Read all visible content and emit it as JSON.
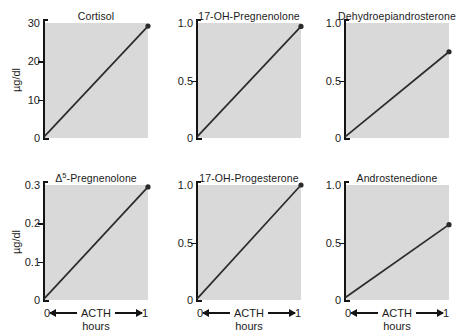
{
  "figure": {
    "layout": {
      "rows": 2,
      "cols": 3
    },
    "axis_color": "#141414",
    "plot_background": "#d9d9d9",
    "line_color": "#2b2b2b",
    "marker_color": "#2b2b2b"
  },
  "chart_data": [
    {
      "type": "line",
      "title": "Cortisol",
      "xlabel": "ACTH hours",
      "ylabel": "µg/dl",
      "x": [
        0,
        1
      ],
      "y": [
        0.3,
        29.2
      ],
      "xlim": [
        0,
        1
      ],
      "ylim": [
        0,
        30
      ],
      "xticks": [
        0,
        1
      ],
      "xticklabels": [
        "0",
        "1"
      ],
      "yticks": [
        0,
        10,
        20,
        30
      ],
      "yticklabels": [
        "0",
        "10",
        "20",
        "30"
      ],
      "grid": false,
      "legend": "none",
      "markers": [
        {
          "x": 1,
          "y": 29.2
        }
      ]
    },
    {
      "type": "line",
      "title": "17-OH-Pregnenolone",
      "xlabel": "ACTH hours",
      "ylabel": "",
      "x": [
        0,
        1
      ],
      "y": [
        0.01,
        0.97
      ],
      "xlim": [
        0,
        1
      ],
      "ylim": [
        0,
        1.0
      ],
      "xticks": [
        0,
        1
      ],
      "xticklabels": [
        "0",
        "1"
      ],
      "yticks": [
        0,
        0.5,
        1.0
      ],
      "yticklabels": [
        "0",
        "0.5",
        "1.0"
      ],
      "grid": false,
      "legend": "none",
      "markers": [
        {
          "x": 1,
          "y": 0.97
        }
      ]
    },
    {
      "type": "line",
      "title": "Dehydroepiandrosterone",
      "xlabel": "ACTH hours",
      "ylabel": "",
      "x": [
        0,
        1
      ],
      "y": [
        0.01,
        0.75
      ],
      "xlim": [
        0,
        1
      ],
      "ylim": [
        0,
        1.0
      ],
      "xticks": [
        0,
        1
      ],
      "xticklabels": [
        "0",
        "1"
      ],
      "yticks": [
        0,
        0.5,
        1.0
      ],
      "yticklabels": [
        "0",
        "0.5",
        "1.0"
      ],
      "grid": false,
      "legend": "none",
      "markers": [
        {
          "x": 1,
          "y": 0.75
        }
      ]
    },
    {
      "type": "line",
      "title": "Δ5-Pregnenolone",
      "title_base": "Δ",
      "title_sup": "5",
      "title_rest": "-Pregnenolone",
      "xlabel": "ACTH hours",
      "ylabel": "µg/dl",
      "x": [
        0,
        1
      ],
      "y": [
        0.003,
        0.295
      ],
      "xlim": [
        0,
        1
      ],
      "ylim": [
        0,
        0.3
      ],
      "xticks": [
        0,
        1
      ],
      "xticklabels": [
        "0",
        "1"
      ],
      "yticks": [
        0,
        0.1,
        0.2,
        0.3
      ],
      "yticklabels": [
        "0",
        "0.1",
        "0.2",
        "0.3"
      ],
      "grid": false,
      "legend": "none",
      "markers": [
        {
          "x": 1,
          "y": 0.295
        }
      ]
    },
    {
      "type": "line",
      "title": "17-OH-Progesterone",
      "xlabel": "ACTH hours",
      "ylabel": "",
      "x": [
        0,
        1
      ],
      "y": [
        0.01,
        1.0
      ],
      "xlim": [
        0,
        1
      ],
      "ylim": [
        0,
        1.0
      ],
      "xticks": [
        0,
        1
      ],
      "xticklabels": [
        "0",
        "1"
      ],
      "yticks": [
        0,
        0.5,
        1.0
      ],
      "yticklabels": [
        "0",
        "0.5",
        "1.0"
      ],
      "grid": false,
      "legend": "none",
      "markers": [
        {
          "x": 1,
          "y": 1.0
        }
      ]
    },
    {
      "type": "line",
      "title": "Androstenedione",
      "xlabel": "ACTH hours",
      "ylabel": "",
      "x": [
        0,
        1
      ],
      "y": [
        0.02,
        0.655
      ],
      "xlim": [
        0,
        1
      ],
      "ylim": [
        0,
        1.0
      ],
      "xticks": [
        0,
        1
      ],
      "xticklabels": [
        "0",
        "1"
      ],
      "yticks": [
        0,
        0.5,
        1.0
      ],
      "yticklabels": [
        "0",
        "0.5",
        "1.0"
      ],
      "grid": false,
      "legend": "none",
      "markers": [
        {
          "x": 1,
          "y": 0.655
        }
      ]
    }
  ],
  "xaxis": {
    "left_label": "0",
    "right_label": "1",
    "name": "ACTH",
    "units": "hours"
  }
}
